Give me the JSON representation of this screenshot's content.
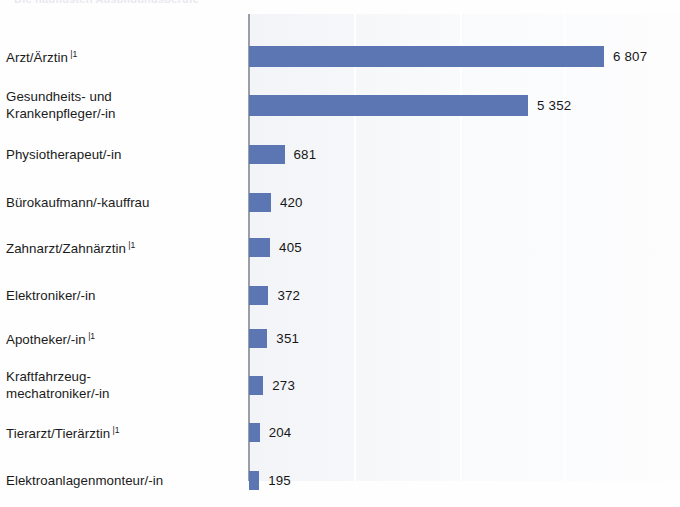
{
  "figure": {
    "cut_title": "Die häufigsten Ausbildungsberufe",
    "footnote_marker": "|1"
  },
  "chart_data": {
    "type": "bar",
    "orientation": "horizontal",
    "title": "",
    "subtitle": "",
    "xlabel": "",
    "ylabel": "",
    "categories": [
      "Arzt/Ärztin",
      "Gesundheits- und\nKrankenpfleger/-in",
      "Physiotherapeut/-in",
      "Bürokaufmann/-kauffrau",
      "Zahnarzt/Zahnärztin",
      "Elektroniker/-in",
      "Apotheker/-in",
      "Kraftfahrzeug-\nmechatroniker/-in",
      "Tierarzt/Tierärztin",
      "Elektroanlagenmonteur/-in"
    ],
    "category_footnotes": [
      "|1",
      "",
      "",
      "",
      "|1",
      "",
      "|1",
      "",
      "|1",
      ""
    ],
    "values": [
      6807,
      5352,
      681,
      420,
      405,
      372,
      351,
      273,
      204,
      195
    ],
    "value_labels": [
      "6 807",
      "5 352",
      "681",
      "420",
      "405",
      "372",
      "351",
      "273",
      "204",
      "195"
    ],
    "xlim": [
      0,
      8300
    ],
    "gridlines": [
      2000,
      4000,
      6000
    ],
    "grid": true,
    "legend": "none",
    "bar_color": "#5c76b4",
    "plot_background": "#f4f6f8",
    "axis_color": "#9a9ea6"
  }
}
